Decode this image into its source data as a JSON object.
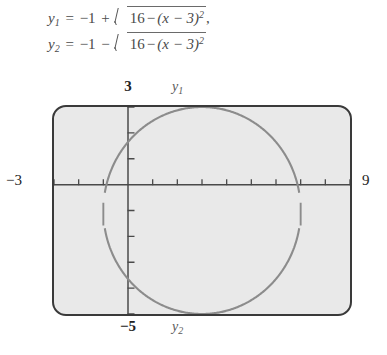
{
  "equations": {
    "line1": {
      "lhs": "y",
      "lhs_sub": "1",
      "equals": "=",
      "lead": "−1",
      "sign": "+",
      "radicand_a": "16",
      "radicand_minus": "−",
      "radicand_b": "(x − 3)",
      "radicand_exp": "2",
      "trailing": ","
    },
    "line2": {
      "lhs": "y",
      "lhs_sub": "2",
      "equals": "=",
      "lead": "−1",
      "sign": "−",
      "radicand_a": "16",
      "radicand_minus": "−",
      "radicand_b": "(x − 3)",
      "radicand_exp": "2",
      "trailing": ""
    },
    "plain_text_1": "y1 = -1 + sqrt(16 - (x - 3)^2),",
    "plain_text_2": "y2 = -1 - sqrt(16 - (x - 3)^2)"
  },
  "window_labels": {
    "ymax": "3",
    "ymin": "−5",
    "xmin": "−3",
    "xmax": "9"
  },
  "curve_labels": {
    "upper": "y₁",
    "upper_base": "y",
    "upper_sub": "1",
    "lower": "y₂",
    "lower_base": "y",
    "lower_sub": "2"
  },
  "colors": {
    "screen_background": "#e9e9e9",
    "screen_border": "#3a3a3a",
    "axis": "#4a4a4a",
    "curve": "#8c8c8c",
    "page_background": "#ffffff",
    "text": "#2b2b2b",
    "equation_text": "#4a4a4a"
  },
  "chart_data": {
    "type": "line",
    "title": "",
    "xlabel": "",
    "ylabel": "",
    "xlim": [
      -3,
      9
    ],
    "ylim": [
      -5,
      3
    ],
    "grid": false,
    "legend": "none",
    "x_tick_step": 1,
    "y_tick_step": 1,
    "x_ticks": [
      -3,
      -2,
      -1,
      0,
      1,
      2,
      3,
      4,
      5,
      6,
      7,
      8,
      9
    ],
    "y_ticks": [
      -5,
      -4,
      -3,
      -2,
      -1,
      0,
      1,
      2,
      3
    ],
    "shape": "circle",
    "circle": {
      "center_x": 3,
      "center_y": -1,
      "radius": 4,
      "equation": "(x - 3)^2 + (y + 1)^2 = 16"
    },
    "series": [
      {
        "name": "y₁",
        "expression": "-1 + sqrt(16 - (x - 3)^2)",
        "domain": [
          -1,
          7
        ],
        "description": "upper semicircle, from (-1,-1) up through (3,3) to (7,-1)",
        "annotation_position": "top"
      },
      {
        "name": "y₂",
        "expression": "-1 - sqrt(16 - (x - 3)^2)",
        "domain": [
          -1,
          7
        ],
        "description": "lower semicircle, from (-1,-1) down through (3,-5) to (7,-1)",
        "annotation_position": "bottom"
      }
    ]
  }
}
